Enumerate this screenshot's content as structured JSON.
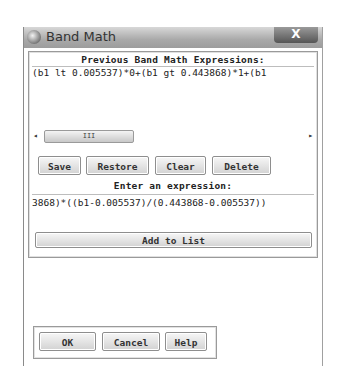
{
  "window": {
    "title": "Band Math",
    "close_label": "X"
  },
  "previous": {
    "label": "Previous Band Math Expressions:",
    "expressions": [
      "(b1 lt 0.005537)*0+(b1 gt 0.443868)*1+(b1"
    ],
    "scroll_thumb_glyph": "III",
    "scroll_left": "◂",
    "scroll_right": "▸"
  },
  "list_buttons": {
    "save": "Save",
    "restore": "Restore",
    "clear": "Clear",
    "delete": "Delete"
  },
  "entry": {
    "label": "Enter an expression:",
    "value": "3868)*((b1-0.005537)/(0.443868-0.005537))",
    "add_button": "Add to List"
  },
  "footer": {
    "ok": "OK",
    "cancel": "Cancel",
    "help": "Help"
  }
}
